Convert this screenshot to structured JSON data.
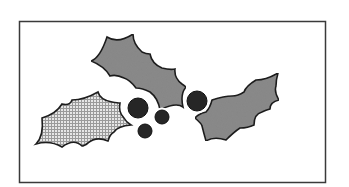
{
  "diagram": {
    "frame": {
      "x": 19,
      "y": 21,
      "width": 307,
      "height": 162,
      "stroke": "#3a3a3a",
      "fill": "#ffffff"
    },
    "colors": {
      "leaf_fill": "#8a8a8a",
      "leaf_stroke": "#1e1e1e",
      "checker_light": "#e6e6e6",
      "checker_dark": "#9a9a9a",
      "berry_fill": "#262626",
      "berry_halo": "#ffffff"
    },
    "leaves": [
      {
        "id": "left-leaf",
        "pattern": "checkered",
        "label": "Checkered holly leaf"
      },
      {
        "id": "top-leaf",
        "pattern": "solid-gray",
        "label": "Upper holly leaf"
      },
      {
        "id": "right-leaf",
        "pattern": "solid-gray",
        "label": "Right holly leaf"
      }
    ],
    "berries": [
      {
        "id": "berry-1",
        "cx": 138,
        "cy": 108,
        "r": 10
      },
      {
        "id": "berry-2",
        "cx": 162,
        "cy": 117,
        "r": 7
      },
      {
        "id": "berry-3",
        "cx": 145,
        "cy": 131,
        "r": 7
      },
      {
        "id": "berry-4",
        "cx": 197,
        "cy": 101,
        "r": 10
      }
    ]
  }
}
